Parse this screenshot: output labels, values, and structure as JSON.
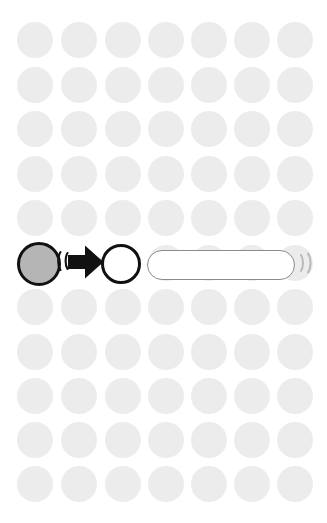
{
  "canvas": {
    "width": 327,
    "height": 523,
    "background_color": "#ffffff",
    "title": "Wireless transfer diagram"
  },
  "background_grid": {
    "name": "dot-grid",
    "dot_color": "#ececec",
    "dot_diameter": 36,
    "columns": 7,
    "rows": 11,
    "column_x": [
      17,
      61,
      105,
      148,
      191,
      234,
      277
    ],
    "row_y": [
      22,
      67,
      111,
      156,
      200,
      245,
      289,
      334,
      378,
      422,
      466
    ],
    "highlighted_row_index": 5
  },
  "diagram": {
    "source_node": {
      "label": "source-node",
      "fill_color": "#b5b5b5",
      "stroke_color": "#111111",
      "stroke_width": 3,
      "x": 17,
      "y": 242,
      "diameter": 44
    },
    "emit_wave_left": {
      "label": "signal-wave-left",
      "glyph": "((",
      "color": "#111111",
      "x": 57,
      "y": 250,
      "arc_count": 2
    },
    "arrow": {
      "label": "transfer-arrow",
      "direction": "right",
      "color": "#111111",
      "x": 68,
      "y": 245,
      "width": 36,
      "height": 34
    },
    "target_node": {
      "label": "target-node",
      "fill_color": "#ffffff",
      "stroke_color": "#111111",
      "stroke_width": 3,
      "x": 101,
      "y": 244,
      "diameter": 40
    },
    "capsule": {
      "label": "receiver-capsule",
      "fill_color": "#ffffff",
      "stroke_color": "#8a8a8a",
      "stroke_width": 1.5,
      "x": 147,
      "y": 250,
      "width": 148,
      "height": 30
    },
    "emit_wave_right": {
      "label": "signal-wave-right",
      "glyph": "))",
      "color": "#b9b9b9",
      "x": 298,
      "y": 252,
      "arc_count": 2
    }
  },
  "accessibility": {
    "description": "A grey filled circle emits a signal and an arrow points to an empty white circle beside a rounded capsule that emits a signal to the right, over a light grey dot grid."
  }
}
